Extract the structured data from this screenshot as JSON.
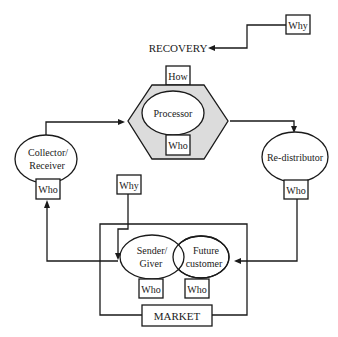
{
  "diagram": {
    "colors": {
      "line": "#1a1a1a",
      "hexagon_fill": "#dcdcdc",
      "background": "#ffffff"
    },
    "recovery": {
      "label": "RECOVERY",
      "why_label": "Why"
    },
    "processor": {
      "label": "Processor",
      "how_label": "How",
      "who_label": "Who",
      "shape": "hexagon"
    },
    "collector": {
      "line1": "Collector/",
      "line2": "Receiver",
      "who_label": "Who"
    },
    "redistributor": {
      "label": "Re-distributor",
      "who_label": "Who"
    },
    "market": {
      "label": "MARKET",
      "why_label": "Why",
      "sender": {
        "line1": "Sender/",
        "line2": "Giver",
        "who_label": "Who"
      },
      "future_customer": {
        "line1": "Future",
        "line2": "customer",
        "who_label": "Who"
      }
    },
    "flows": [
      {
        "from": "Why",
        "to": "RECOVERY"
      },
      {
        "from": "Collector/Receiver",
        "to": "Processor"
      },
      {
        "from": "Processor",
        "to": "Re-distributor"
      },
      {
        "from": "Re-distributor",
        "to": "Future customer"
      },
      {
        "from": "Sender/Giver",
        "to": "Collector/Receiver"
      },
      {
        "from": "Why",
        "to": "Sender/Giver"
      }
    ]
  }
}
